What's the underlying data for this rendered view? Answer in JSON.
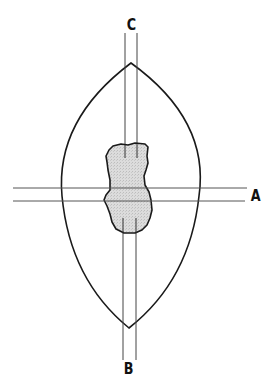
{
  "diagram": {
    "type": "lens cross-section with opacity and section planes",
    "labels": {
      "a": "A",
      "b": "B",
      "c": "C"
    },
    "colors": {
      "stroke": "#1a1a1a",
      "section_line": "#555555",
      "opacity_fill": "#d6d6d6",
      "background": "#ffffff"
    }
  }
}
